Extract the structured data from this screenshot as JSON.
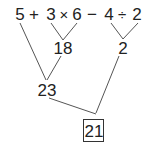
{
  "expression": {
    "tokens": [
      "5",
      "+",
      "3",
      "×",
      "6",
      "−",
      "4",
      "÷",
      "2"
    ]
  },
  "intermediate": {
    "product": "18",
    "quotient": "2",
    "sum": "23"
  },
  "result": "21",
  "colors": {
    "line": "#555555",
    "text": "#222222",
    "box_border": "#333333"
  }
}
